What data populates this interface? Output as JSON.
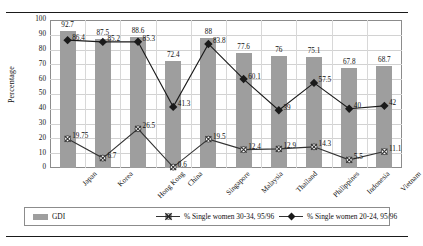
{
  "chart_data": {
    "type": "bar",
    "title": "",
    "xlabel": "",
    "ylabel": "Percentage",
    "ylim": [
      0,
      100
    ],
    "ytick_step": 10,
    "yticks": [
      "100",
      "90",
      "80",
      "70",
      "60",
      "50",
      "40",
      "30",
      "20",
      "10",
      "0"
    ],
    "grid": true,
    "legend_position": "bottom",
    "categories": [
      "Japan",
      "Korea",
      "Hong Kong",
      "China",
      "Singapore",
      "Malaysia",
      "Thailand",
      "Philippines",
      "Indonesia",
      "Vietnam"
    ],
    "series": [
      {
        "name": "GDI",
        "type": "bar",
        "color": "#9e9e9e",
        "values": [
          92.7,
          87.5,
          88.6,
          72.4,
          88,
          77.6,
          76,
          75.1,
          67.8,
          68.7
        ],
        "labels": [
          "92.7",
          "87.5",
          "88.6",
          "72.4",
          "88",
          "77.6",
          "76",
          "75.1",
          "67.8",
          "68.7"
        ]
      },
      {
        "name": "% Single women 30-34, 95/96",
        "type": "line",
        "marker": "x",
        "color": "#333333",
        "values": [
          19.75,
          6.7,
          26.5,
          0.6,
          19.5,
          12.4,
          12.9,
          14.3,
          5.5,
          11.1
        ],
        "labels": [
          "19.75",
          "6.7",
          "26.5",
          "0.6",
          "19.5",
          "12.4",
          "12.9",
          "14.3",
          "5.5",
          "11.1"
        ]
      },
      {
        "name": "% Single women 20-24, 95/96",
        "type": "line",
        "marker": "diamond",
        "color": "#1a1a1a",
        "values": [
          86.4,
          85.2,
          85.3,
          41.3,
          83.8,
          60.1,
          39,
          57.5,
          40,
          42
        ],
        "labels": [
          "86.4",
          "85.2",
          "85.3",
          "41.3",
          "83.8",
          "60.1",
          "39",
          "57.5",
          "40",
          "42"
        ]
      }
    ]
  },
  "legend": {
    "items": [
      {
        "label": "GDI",
        "marker": "bar-swatch"
      },
      {
        "label": "% Single women 30-34, 95/96",
        "marker": "x-marker"
      },
      {
        "label": "% Single women 20-24, 95/96",
        "marker": "diamond-marker"
      }
    ]
  }
}
